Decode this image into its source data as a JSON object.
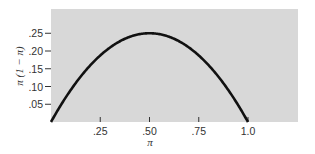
{
  "chart_data": {
    "type": "line",
    "title": "",
    "xlabel": "π",
    "ylabel": "π (1 − π)",
    "xlim": [
      0,
      1.25
    ],
    "ylim": [
      0,
      0.32
    ],
    "x_ticks": [
      ".25",
      ".50",
      ".75",
      "1.0"
    ],
    "y_ticks": [
      ".05",
      ".10",
      ".15",
      ".20",
      ".25"
    ],
    "grid": false,
    "legend": null,
    "background": "#d8d8d8",
    "line_color": "#111111",
    "series": [
      {
        "name": "π(1 − π)",
        "x": [
          0,
          0.05,
          0.1,
          0.15,
          0.2,
          0.25,
          0.3,
          0.35,
          0.4,
          0.45,
          0.5,
          0.55,
          0.6,
          0.65,
          0.7,
          0.75,
          0.8,
          0.85,
          0.9,
          0.95,
          1.0
        ],
        "y": [
          0,
          0.0475,
          0.09,
          0.1275,
          0.16,
          0.1875,
          0.21,
          0.2275,
          0.24,
          0.2475,
          0.25,
          0.2475,
          0.24,
          0.2275,
          0.21,
          0.1875,
          0.16,
          0.1275,
          0.09,
          0.0475,
          0
        ]
      }
    ]
  }
}
